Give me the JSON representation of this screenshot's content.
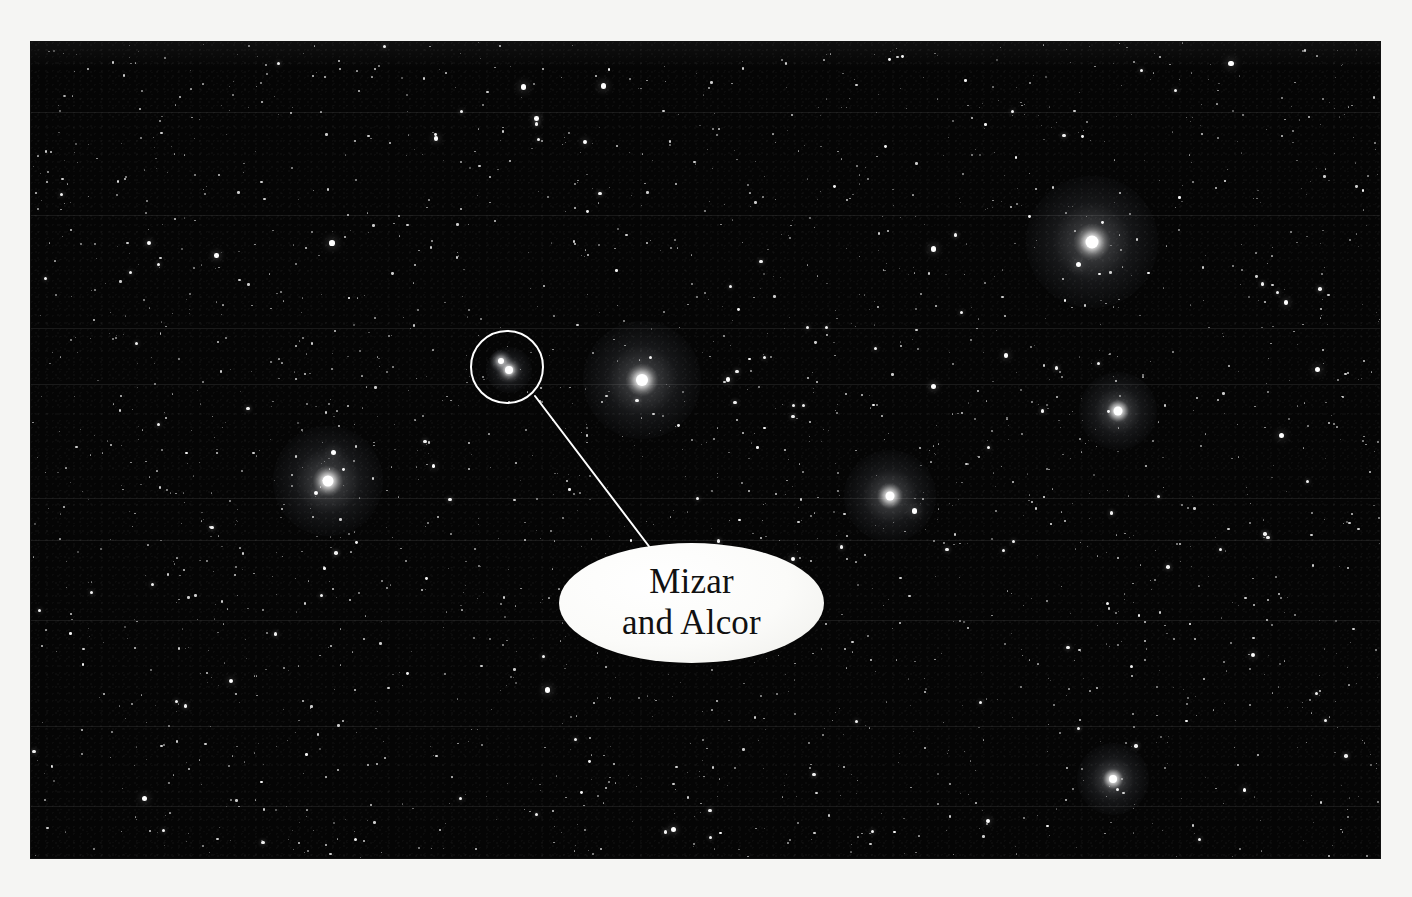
{
  "page": {
    "background_color": "#f5f5f3",
    "width": 1412,
    "height": 897
  },
  "photograph": {
    "kind": "astrophotograph",
    "subject": "night sky star field containing the Big Dipper handle region",
    "background_color": "#050505",
    "frame": {
      "x": 31,
      "y": 42,
      "width": 1349,
      "height": 816
    },
    "scanline_ys": [
      112,
      215,
      328,
      384,
      498,
      540,
      620,
      726,
      806
    ],
    "bright_stars": [
      {
        "name": "bright-star-upper-right",
        "x": 1092,
        "y": 242,
        "core": 13,
        "halo": 132
      },
      {
        "name": "bright-star-center-left",
        "x": 642,
        "y": 380,
        "core": 12,
        "halo": 118
      },
      {
        "name": "bright-star-left-middle",
        "x": 328,
        "y": 481,
        "core": 11,
        "halo": 110
      },
      {
        "name": "bright-star-center-right",
        "x": 890,
        "y": 496,
        "core": 9,
        "halo": 92
      },
      {
        "name": "bright-star-right",
        "x": 1118,
        "y": 411,
        "core": 9,
        "halo": 78
      },
      {
        "name": "bright-star-lower-right",
        "x": 1113,
        "y": 779,
        "core": 8,
        "halo": 72
      },
      {
        "name": "star-mizar",
        "x": 509,
        "y": 370,
        "core": 8,
        "halo": 46
      },
      {
        "name": "star-alcor",
        "x": 501,
        "y": 361,
        "core": 6,
        "halo": 22
      }
    ]
  },
  "annotation": {
    "circle": {
      "name": "mizar-alcor-callout-circle",
      "center_x": 507,
      "center_y": 367,
      "radius": 37,
      "stroke_color": "#ffffff",
      "stroke_width": 2
    },
    "leader_line": {
      "name": "callout-leader-line",
      "x1": 535,
      "y1": 396,
      "x2": 651,
      "y2": 549,
      "stroke_color": "#ffffff",
      "stroke_width": 2
    },
    "label": {
      "name": "mizar-and-alcor-label",
      "text": "Mizar\nand Alcor",
      "text_color": "#111111",
      "fill_color": "#ffffff",
      "shape": "ellipse",
      "x": 559,
      "y": 543,
      "width": 265,
      "height": 120
    }
  }
}
